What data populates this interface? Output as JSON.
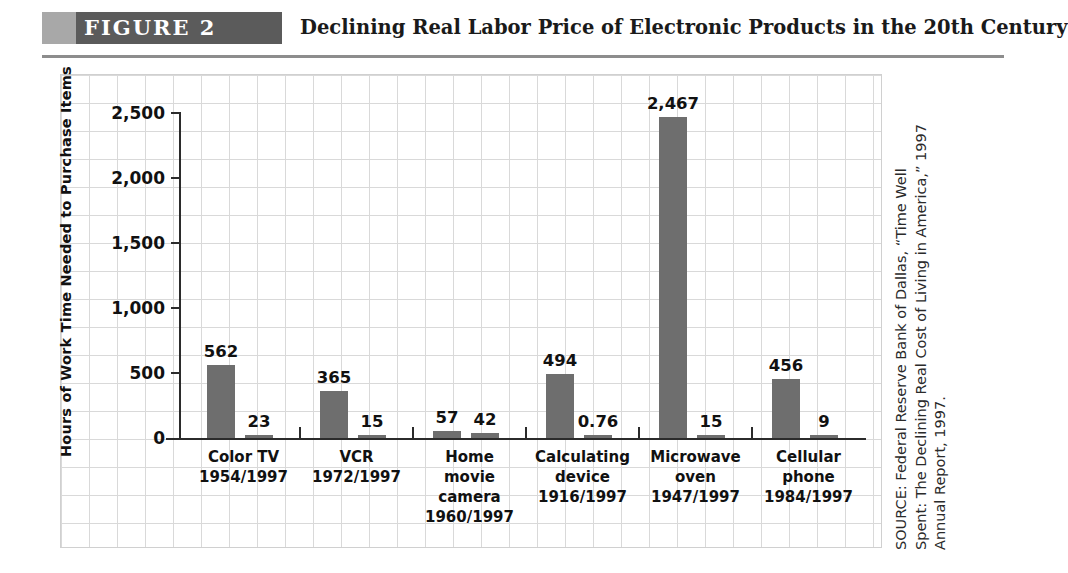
{
  "header": {
    "figure_label": "FIGURE  2",
    "title": "Declining Real Labor Price of Electronic Products in the 20th Century"
  },
  "source": {
    "text": "SOURCE: Federal Reserve Bank of Dallas, “Time Well Spent: The Declining Real Cost of Living in America,” 1997 Annual Report, 1997."
  },
  "colors": {
    "bar": "#6e6e6e",
    "banner": "#5b5b5b",
    "banner_cap": "#a8a8a8",
    "axis": "#2b2b2b",
    "grid": "#d9d9d9"
  },
  "chart_data": {
    "type": "bar",
    "title": "Declining Real Labor Price of Electronic Products in the 20th Century",
    "xlabel": "",
    "ylabel": "Hours of Work Time Needed to Purchase Items",
    "ylim": [
      0,
      2500
    ],
    "yticks": [
      0,
      500,
      1000,
      1500,
      2000,
      2500
    ],
    "ytick_labels": [
      "0",
      "500",
      "1,000",
      "1,500",
      "2,000",
      "2,500"
    ],
    "grid": true,
    "legend": "none",
    "categories": [
      "Color TV\n1954/1997",
      "VCR\n1972/1997",
      "Home\nmovie\ncamera\n1960/1997",
      "Calculating\ndevice\n1916/1997",
      "Microwave\noven\n1947/1997",
      "Cellular\nphone\n1984/1997"
    ],
    "category_names": [
      "Color TV",
      "VCR",
      "Home movie camera",
      "Calculating device",
      "Microwave oven",
      "Cellular phone"
    ],
    "category_years": [
      "1954/1997",
      "1972/1997",
      "1960/1997",
      "1916/1997",
      "1947/1997",
      "1984/1997"
    ],
    "series": [
      {
        "name": "Introduction year",
        "values": [
          562,
          365,
          57,
          494,
          2467,
          456
        ],
        "labels": [
          "562",
          "365",
          "57",
          "494",
          "2,467",
          "456"
        ]
      },
      {
        "name": "1997",
        "values": [
          23,
          15,
          42,
          0.76,
          15,
          9
        ],
        "labels": [
          "23",
          "15",
          "42",
          "0.76",
          "15",
          "9"
        ]
      }
    ]
  }
}
